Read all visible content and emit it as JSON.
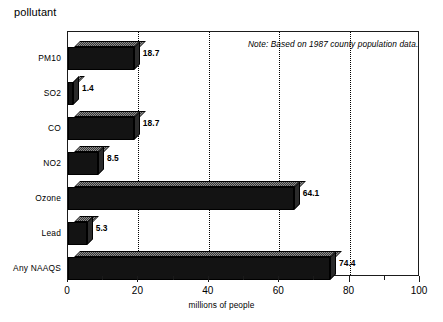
{
  "chart_data": {
    "type": "bar",
    "orientation": "horizontal",
    "title": "",
    "ylabel": "pollutant",
    "xlabel": "millions of people",
    "categories": [
      "PM10",
      "SO2",
      "CO",
      "NO2",
      "Ozone",
      "Lead",
      "Any NAAQS"
    ],
    "values": [
      18.7,
      1.4,
      18.7,
      8.5,
      64.1,
      5.3,
      74.4
    ],
    "value_labels": [
      "18.7",
      "1.4",
      "18.7",
      "8.5",
      "64.1",
      "5.3",
      "74.4"
    ],
    "xlim": [
      0,
      100
    ],
    "xticks": [
      0,
      20,
      40,
      60,
      80,
      100
    ],
    "xtick_labels": [
      "0",
      "20",
      "40",
      "60",
      "80",
      "100"
    ],
    "xminor_ticks": [
      10,
      30,
      50,
      70,
      90
    ],
    "gridlines": [
      20,
      40,
      60,
      80
    ],
    "grid": true,
    "legend": false,
    "annotation": "Note: Based on 1987 county population data.",
    "bar_color": "#131313",
    "frame_color": "#1b1b1b",
    "background": "#ffffff"
  }
}
